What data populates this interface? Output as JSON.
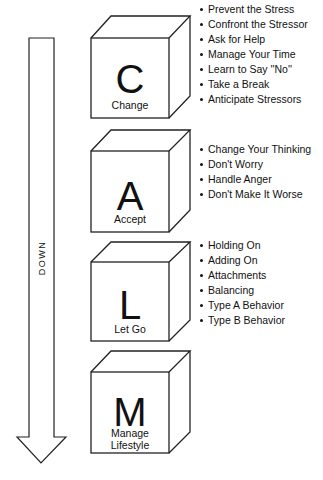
{
  "arrow": {
    "label": "DOWN",
    "direction": "down"
  },
  "steps": [
    {
      "letter": "C",
      "caption": "Change",
      "items": [
        "Prevent the Stress",
        "Confront the Stressor",
        "Ask for Help",
        "Manage Your Time",
        "Learn to Say ''No''",
        "Take a Break",
        "Anticipate Stressors"
      ]
    },
    {
      "letter": "A",
      "caption": "Accept",
      "items": [
        "Change Your Thinking",
        "Don't Worry",
        "Handle Anger",
        "Don't Make It Worse"
      ]
    },
    {
      "letter": "L",
      "caption": "Let Go",
      "items": [
        "Holding On",
        "Adding On",
        "Attachments",
        "Balancing",
        "Type A Behavior",
        "Type B Behavior"
      ]
    },
    {
      "letter": "M",
      "caption_line1": "Manage",
      "caption_line2": "Lifestyle",
      "items": []
    }
  ]
}
